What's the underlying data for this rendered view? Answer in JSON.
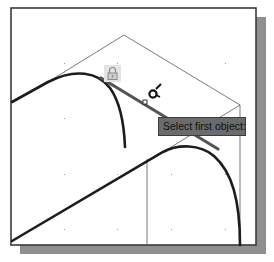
{
  "viewport": {
    "background": "#ffffff",
    "border_color": "#3a3a3a",
    "shadow_color": "#8f8f8f"
  },
  "tooltip": {
    "text": "Select first object:",
    "background": "#6b6b6b"
  },
  "icons": {
    "lock": "lock-icon",
    "cursor": "pickbox-cursor-icon",
    "snap_marker": "snap-marker-icon"
  },
  "drawing": {
    "grid_dots": {
      "x": [
        64,
        117,
        171,
        225
      ],
      "y": [
        63,
        118,
        174,
        229
      ]
    },
    "thin_line_color": "#6a6a6a",
    "thick_line_color": "#1c1c1c",
    "highlighted_line_color": "#555555"
  }
}
